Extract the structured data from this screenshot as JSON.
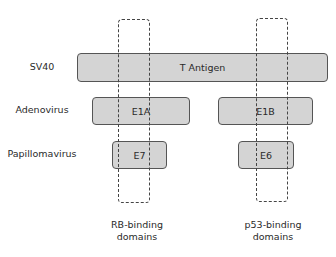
{
  "rows": [
    {
      "label": "SV40"
    },
    {
      "label": "Adenovirus"
    },
    {
      "label": "Papillomavirus"
    }
  ],
  "proteins": {
    "t_antigen": "T Antigen",
    "e1a": "E1A",
    "e1b": "E1B",
    "e7": "E7",
    "e6": "E6"
  },
  "domains": {
    "rb": {
      "line1": "RB-binding",
      "line2": "domains"
    },
    "p53": {
      "line1": "p53-binding",
      "line2": "domains"
    }
  },
  "colors": {
    "box_fill": "#d4d4d4",
    "box_border": "#555555",
    "dash": "#444444"
  }
}
